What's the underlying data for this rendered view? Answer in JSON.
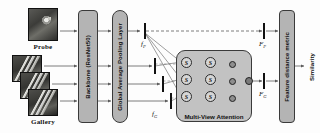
{
  "figure": {
    "background": "#fdfdfd"
  },
  "inputs": {
    "probe": {
      "label": "Probe",
      "count": 1,
      "icon": "probe-image-thumbnail"
    },
    "gallery": {
      "label": "Gallery",
      "count": 3,
      "icon": "gallery-image-thumbnail"
    }
  },
  "modules": {
    "backbone": {
      "label": "Backbone (ResNet50)",
      "color": "#b4b4b4"
    },
    "pooling": {
      "label": "Global Average Pooling Layer",
      "color": "#b4b4b4"
    },
    "attention": {
      "label": "Multi-View Attention",
      "color": "#c2c2c2"
    },
    "metric": {
      "label": "Feature distance metric",
      "color": "#b4b4b4"
    }
  },
  "attention_nodes": {
    "score_glyph": "S",
    "layer1": [
      "S",
      "S",
      "S"
    ],
    "layer2": [
      "S",
      "S",
      "S"
    ],
    "multiply_glyph": "⊗",
    "multiply_count": 3,
    "sum_glyph": "⊕"
  },
  "labels": {
    "f_probe": "f",
    "f_probe_sub": "P",
    "f_gallery": "f",
    "f_gallery_sub": "G",
    "F_probe": "F",
    "F_probe_sub": "P",
    "F_gallery": "F",
    "F_gallery_sub": "G"
  },
  "output": {
    "label": "Similarity"
  },
  "colors": {
    "block_fill": "#b4b4b4",
    "attention_fill": "#c2c2c2",
    "node_fill": "#d6d6d6",
    "line": "#5a5a5a",
    "text": "#111111"
  }
}
